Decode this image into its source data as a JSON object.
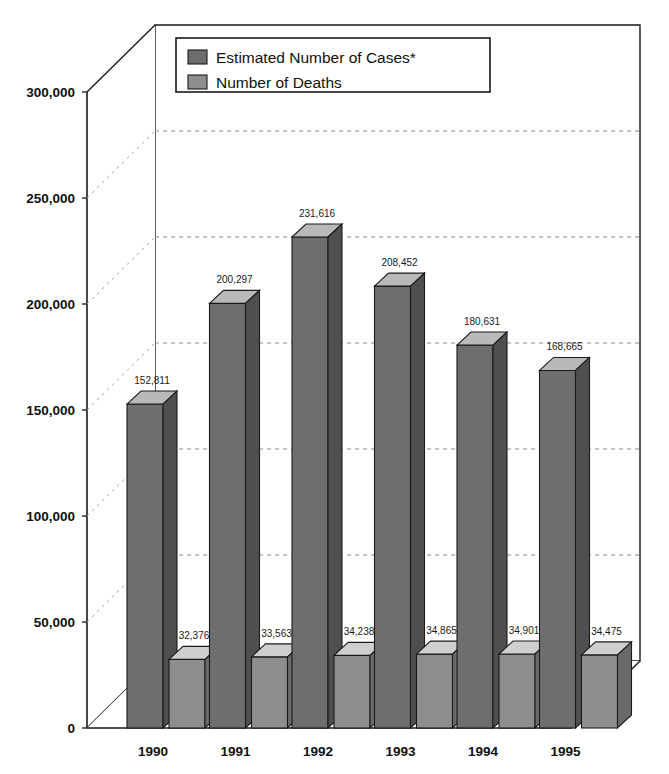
{
  "chart_data": {
    "type": "bar",
    "title": "",
    "subtitle": "",
    "xlabel": "",
    "ylabel": "",
    "categories": [
      "1990",
      "1991",
      "1992",
      "1993",
      "1994",
      "1995"
    ],
    "series": [
      {
        "name": "Estimated Number of Cases*",
        "color": "#6e6e6e",
        "values": [
          152811,
          200297,
          231616,
          208452,
          180631,
          168665
        ],
        "labels": [
          "152,811",
          "200,297",
          "231,616",
          "208,452",
          "180,631",
          "168,665"
        ]
      },
      {
        "name": "Number of Deaths",
        "color": "#8a8a8a",
        "values": [
          32376,
          33563,
          34238,
          34865,
          34901,
          34475
        ],
        "labels": [
          "32,376",
          "33,563",
          "34,238",
          "34,865",
          "34,901",
          "34,475"
        ]
      }
    ],
    "ylim": [
      0,
      300000
    ],
    "yticks": [
      0,
      50000,
      100000,
      150000,
      200000,
      250000,
      300000
    ],
    "ytick_labels": [
      "0",
      "50,000",
      "100,000",
      "150,000",
      "200,000",
      "250,000",
      "300,000"
    ],
    "grid": true,
    "grid_style": "dashed-horizontal-on-back-wall",
    "legend_position": "top-center-inside",
    "projection": "3d-isometric"
  },
  "legend": {
    "entries": [
      {
        "label": "Estimated Number of Cases*",
        "swatch": "legend-swatch-cases"
      },
      {
        "label": "Number of Deaths",
        "swatch": "legend-swatch-deaths"
      }
    ]
  },
  "colors": {
    "cases_front": "#6e6e6e",
    "cases_top": "#b9b9b9",
    "cases_side": "#4f4f4f",
    "deaths_front": "#8e8e8e",
    "deaths_top": "#cfcfcf",
    "deaths_side": "#6a6a6a",
    "outline": "#1a1a1a",
    "grid": "#8d8d8d",
    "background": "#ffffff"
  }
}
